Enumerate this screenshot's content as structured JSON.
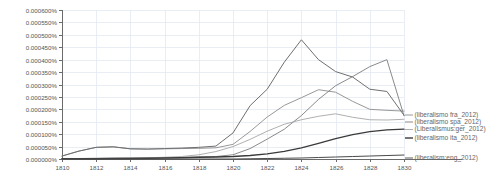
{
  "chart_data": {
    "type": "line",
    "title": "",
    "subtitle": "",
    "xlabel": "",
    "ylabel": "",
    "xlim": [
      1810,
      1830
    ],
    "ylim": [
      0.0,
      0.0006
    ],
    "grid": true,
    "legend_position": "right-inline",
    "x": [
      1810,
      1811,
      1812,
      1813,
      1814,
      1815,
      1816,
      1817,
      1818,
      1819,
      1820,
      1821,
      1822,
      1823,
      1824,
      1825,
      1826,
      1827,
      1828,
      1829,
      1830
    ],
    "xticks": [
      "1810",
      "1812",
      "1814",
      "1816",
      "1818",
      "1820",
      "1822",
      "1824",
      "1826",
      "1828",
      "1830"
    ],
    "yticks": [
      "0.000000%",
      "0.000050%",
      "0.000100%",
      "0.000150%",
      "0.000200%",
      "0.000250%",
      "0.000300%",
      "0.000350%",
      "0.000400%",
      "0.000450%",
      "0.000500%",
      "0.000550%",
      "0.000600%"
    ],
    "ytick_values": [
      0.0,
      5e-05,
      0.0001,
      0.00015,
      0.0002,
      0.00025,
      0.0003,
      0.00035,
      0.0004,
      0.00045,
      0.0005,
      0.00055,
      0.0006
    ],
    "series": [
      {
        "name": "(liberalismo fra_2012)",
        "label": "(liberalismo fra_2012)",
        "color": "#8c8c8c",
        "width": 0.9,
        "values": [
          1.2e-05,
          3.2e-05,
          4.7e-05,
          4.9e-05,
          4.1e-05,
          4e-05,
          4.1e-05,
          4.2e-05,
          4.3e-05,
          4.5e-05,
          5.9e-05,
          0.000111,
          0.000169,
          0.000216,
          0.000247,
          0.000279,
          0.000269,
          0.000232,
          0.0002,
          0.000196,
          0.000193
        ]
      },
      {
        "name": "(liberalismo spa_2012)",
        "label": "(liberalismo spa_2012)",
        "color": "#7d7d7d",
        "width": 0.9,
        "values": [
          2e-06,
          2e-06,
          3e-06,
          3e-06,
          4e-06,
          4e-06,
          5e-06,
          6e-06,
          8e-06,
          1e-05,
          1.7e-05,
          4.2e-05,
          8e-05,
          0.00012,
          0.000175,
          0.00024,
          0.000295,
          0.000332,
          0.000372,
          0.0004,
          0.000174
        ]
      },
      {
        "name": "(Liberalismus ger_2012)",
        "label": "(Liberalismus:ger_2012)",
        "color": "#a6a6a6",
        "width": 0.9,
        "values": [
          1e-06,
          2e-06,
          2e-06,
          3e-06,
          4e-06,
          5e-06,
          7e-06,
          1e-05,
          1.7e-05,
          3e-05,
          5e-05,
          7.9e-05,
          0.000112,
          0.00014,
          0.000158,
          0.000172,
          0.000182,
          0.000168,
          0.000158,
          0.000157,
          0.00016
        ]
      },
      {
        "name": "(liberalismo ita_2012)",
        "label": "(liberalismo ita_2012)",
        "color": "#3a3a3a",
        "width": 1.3,
        "values": [
          1e-06,
          1e-06,
          1e-06,
          2e-06,
          2e-06,
          3e-06,
          4e-06,
          5e-06,
          7e-06,
          8e-06,
          1e-05,
          1.4e-05,
          2.1e-05,
          3.1e-05,
          4.5e-05,
          6.3e-05,
          8.2e-05,
          9.8e-05,
          0.00011,
          0.000117,
          0.00012
        ]
      },
      {
        "name": "(liberalism eng_2012)",
        "label": "(liberalism:eng_2012)",
        "color": "#4a4a4a",
        "width": 1.0,
        "values": [
          0.0,
          0.0,
          0.0,
          0.0,
          0.0,
          0.0,
          0.0,
          0.0,
          0.0,
          0.0,
          0.0,
          1e-06,
          2e-06,
          3e-06,
          4e-06,
          6e-06,
          8e-06,
          1e-05,
          1.2e-05,
          1.4e-05,
          1.6e-05
        ]
      },
      {
        "name": "peak-series-fra",
        "label": "",
        "color": "#6f6f6f",
        "width": 1.0,
        "hidden_from_legend": true,
        "values": [
          1.2e-05,
          3.2e-05,
          4.7e-05,
          4.9e-05,
          4.1e-05,
          4e-05,
          4.2e-05,
          4.4e-05,
          4.7e-05,
          5.2e-05,
          0.000105,
          0.000215,
          0.000281,
          0.00039,
          0.00048,
          0.0004,
          0.000352,
          0.00033,
          0.000281,
          0.000272,
          0.000176
        ]
      }
    ]
  },
  "plot_geometry": {
    "left": 62,
    "right": 404,
    "top": 10,
    "bottom": 159
  },
  "legend_entries": [
    {
      "label": "(liberalismo fra_2012)",
      "color": "#8c8c8c",
      "y": 115
    },
    {
      "label": "(liberalismo spa_2012)",
      "color": "#7d7d7d",
      "y": 122
    },
    {
      "label": "(Liberalismus:ger_2012)",
      "color": "#a6a6a6",
      "y": 129.5
    },
    {
      "label": "(liberalismo ita_2012)",
      "color": "#3a3a3a",
      "y": 138
    },
    {
      "label": "(liberalism:eng_2012)",
      "color": "#4a4a4a",
      "y": 158
    }
  ],
  "colors": {
    "background": "#ffffff",
    "axis": "#6b6b6b",
    "grid": "#dfe6ef",
    "tick_text": "#555555",
    "legend_text": "#666666"
  }
}
